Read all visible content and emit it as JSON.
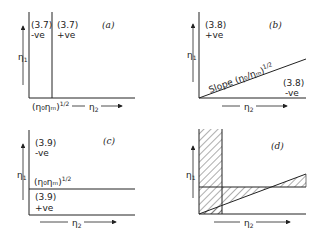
{
  "panels": {
    "a": {
      "label": "(a)",
      "left_region": {
        "eq": "(3.7)",
        "sign": "-ve"
      },
      "right_region": {
        "eq": "(3.7)",
        "sign": "+ve"
      },
      "boundary_label": "(η₀ηₘ)",
      "boundary_exp": "1/2",
      "x_axis": "η",
      "x_sub": "2",
      "y_axis": "η",
      "y_sub": "1"
    },
    "b": {
      "label": "(b)",
      "upper_region": {
        "eq": "(3.8)",
        "sign": "+ve"
      },
      "lower_region": {
        "eq": "(3.8)",
        "sign": "-ve"
      },
      "line_label": "Slope (η₀/ηₘ)",
      "line_exp": "1/2",
      "x_axis": "η",
      "x_sub": "2",
      "y_axis": "η",
      "y_sub": "1"
    },
    "c": {
      "label": "(c)",
      "upper_region": {
        "eq": "(3.9)",
        "sign": "-ve"
      },
      "lower_region": {
        "eq": "(3.9)",
        "sign": "+ve"
      },
      "boundary_label": "(η₀ηₘ)",
      "boundary_exp": "1/2",
      "x_axis": "η",
      "x_sub": "2",
      "y_axis": "η",
      "y_sub": "1"
    },
    "d": {
      "label": "(d)",
      "x_axis": "η",
      "x_sub": "2",
      "y_axis": "η",
      "y_sub": "1"
    }
  }
}
